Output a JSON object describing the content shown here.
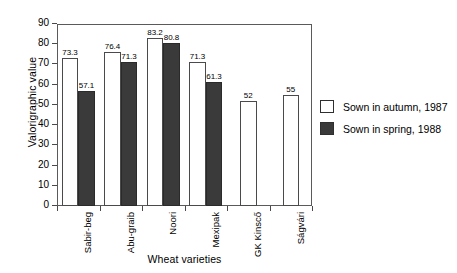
{
  "chart_data": {
    "type": "bar",
    "title": "",
    "xlabel": "Wheat varieties",
    "ylabel": "Valorigraphic value",
    "ylim": [
      0,
      90
    ],
    "yticks": [
      0,
      10,
      20,
      30,
      40,
      50,
      60,
      70,
      80,
      90
    ],
    "ytick_labels": [
      "0",
      "10",
      "20",
      "30",
      "40",
      "50",
      "60",
      "70",
      "80",
      "90"
    ],
    "grid": false,
    "legend_position": "right",
    "categories": [
      "Sabir-beg",
      "Abu-graib",
      "Noori",
      "Mexipak",
      "GK Kinscő",
      "Ságvári"
    ],
    "series": [
      {
        "name": "Sown in autumn, 1987",
        "color": "#ffffff",
        "values": [
          73.3,
          76.4,
          83.2,
          71.3,
          52,
          55
        ],
        "labels": [
          "73.3",
          "76.4",
          "83.2",
          "71.3",
          "52",
          "55"
        ]
      },
      {
        "name": "Sown in spring, 1988",
        "color": "#3a3a3a",
        "values": [
          57.1,
          71.3,
          80.8,
          61.3,
          null,
          null
        ],
        "labels": [
          "57.1",
          "71.3",
          "80.8",
          "61.3",
          "",
          ""
        ]
      }
    ]
  },
  "legend": {
    "items": [
      {
        "label": "Sown in autumn, 1987",
        "swatch": "autumn"
      },
      {
        "label": "Sown in spring, 1988",
        "swatch": "spring"
      }
    ]
  }
}
